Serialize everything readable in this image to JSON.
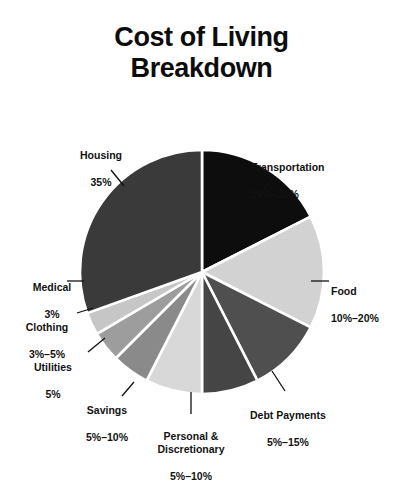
{
  "chart_data": {
    "type": "pie",
    "title": "Cost of Living\nBreakdown",
    "title_line1": "Cost of Living",
    "title_line2": "Breakdown",
    "xlabel": "",
    "ylabel": "",
    "legend": "none",
    "grid": false,
    "labels_show_percent_ranges": true,
    "categories": [
      "Transportation",
      "Food",
      "Debt Payments",
      "Personal & Discretionary",
      "Savings",
      "Utilities",
      "Clothing",
      "Medical",
      "Housing"
    ],
    "values": [
      17.5,
      15.0,
      10.0,
      7.5,
      7.5,
      5.0,
      4.0,
      3.0,
      35.0
    ],
    "slices": [
      {
        "name": "Transportation",
        "label": "Transportation",
        "percent_text": "15%–20%",
        "value": 17.5,
        "range_min": 15,
        "range_max": 20,
        "color": "#0d0d0d",
        "start_angle_deg": 0.0,
        "end_angle_deg": 63.0
      },
      {
        "name": "Food",
        "label": "Food",
        "percent_text": "10%–20%",
        "value": 15.0,
        "range_min": 10,
        "range_max": 20,
        "color": "#d2d2d2",
        "start_angle_deg": 63.0,
        "end_angle_deg": 117.0
      },
      {
        "name": "Debt Payments",
        "label": "Debt Payments",
        "percent_text": "5%–15%",
        "value": 10.0,
        "range_min": 5,
        "range_max": 15,
        "color": "#4f4f4f",
        "start_angle_deg": 117.0,
        "end_angle_deg": 153.0
      },
      {
        "name": "Personal & Discretionary",
        "label": "Personal &\nDiscretionary",
        "percent_text": "5%–10%",
        "value": 7.5,
        "range_min": 5,
        "range_max": 10,
        "color": "#454545",
        "start_angle_deg": 153.0,
        "end_angle_deg": 180.0
      },
      {
        "name": "Savings",
        "label": "Savings",
        "percent_text": "5%–10%",
        "value": 7.5,
        "range_min": 5,
        "range_max": 10,
        "color": "#d8d8d8",
        "start_angle_deg": 180.0,
        "end_angle_deg": 207.0
      },
      {
        "name": "Utilities",
        "label": "Utilities",
        "percent_text": "5%",
        "value": 5.0,
        "range_min": 5,
        "range_max": 5,
        "color": "#8a8a8a",
        "start_angle_deg": 207.0,
        "end_angle_deg": 225.0
      },
      {
        "name": "Clothing",
        "label": "Clothing",
        "percent_text": "3%–5%",
        "value": 4.0,
        "range_min": 3,
        "range_max": 5,
        "color": "#9d9d9d",
        "start_angle_deg": 225.0,
        "end_angle_deg": 239.5
      },
      {
        "name": "Medical",
        "label": "Medical",
        "percent_text": "3%",
        "value": 3.0,
        "range_min": 3,
        "range_max": 3,
        "color": "#c6c6c6",
        "start_angle_deg": 239.5,
        "end_angle_deg": 250.3
      },
      {
        "name": "Housing",
        "label": "Housing",
        "percent_text": "35%",
        "value": 35.0,
        "range_min": 35,
        "range_max": 35,
        "color": "#3a3a3a",
        "start_angle_deg": 250.3,
        "end_angle_deg": 360.0
      }
    ],
    "geometry": {
      "center_x": 202,
      "center_y": 272,
      "radius": 122,
      "separator_color": "#ffffff",
      "separator_width": 2.6,
      "background": "#ffffff"
    },
    "leaders": [
      {
        "name": "Transportation",
        "x1": 258,
        "y1": 197,
        "x2": 274,
        "y2": 176
      },
      {
        "name": "Food",
        "x1": 311,
        "y1": 281,
        "x2": 329,
        "y2": 281
      },
      {
        "name": "Debt Payments",
        "x1": 272,
        "y1": 371,
        "x2": 285,
        "y2": 391
      },
      {
        "name": "Personal & Discretionary",
        "x1": 191,
        "y1": 392,
        "x2": 191,
        "y2": 414
      },
      {
        "name": "Savings",
        "x1": 134,
        "y1": 382,
        "x2": 122,
        "y2": 396
      },
      {
        "name": "Utilities",
        "x1": 105,
        "y1": 338,
        "x2": 88,
        "y2": 352
      },
      {
        "name": "Clothing",
        "x1": 93,
        "y1": 308,
        "x2": 77,
        "y2": 313
      },
      {
        "name": "Medical",
        "x1": 84,
        "y1": 281,
        "x2": 67,
        "y2": 281
      },
      {
        "name": "Housing",
        "x1": 124,
        "y1": 186,
        "x2": 111,
        "y2": 170
      }
    ],
    "text_colors": {
      "title": "#0c0c0c",
      "labels": "#121212"
    }
  }
}
